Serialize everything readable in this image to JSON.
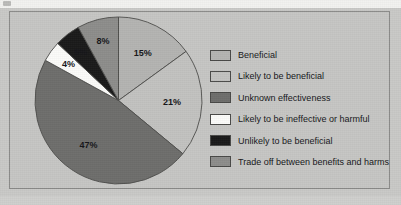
{
  "chart_data": {
    "type": "pie",
    "title": "",
    "categories": [
      "Beneficial",
      "Likely to be beneficial",
      "Unknown effectiveness",
      "Likely to be ineffective or harmful",
      "Unlikely to be beneficial",
      "Trade off between benefits and harms"
    ],
    "values": [
      15,
      21,
      47,
      4,
      5,
      8
    ],
    "value_labels": [
      "15%",
      "21%",
      "47%",
      "4%",
      "5%",
      "8%"
    ],
    "colors": [
      "#b4b4b2",
      "#c2c2c0",
      "#6e6e6c",
      "#fbfbf9",
      "#1a1a1a",
      "#8d8d8b"
    ],
    "label_color": "#16161a",
    "start_angle": 0,
    "direction": "clockwise",
    "legend_position": "right",
    "grid": false,
    "background": "#c6c6c4"
  },
  "legend": {
    "items": [
      {
        "label": "Beneficial",
        "color": "#b4b4b2"
      },
      {
        "label": "Likely to be beneficial",
        "color": "#c2c2c0"
      },
      {
        "label": "Unknown effectiveness",
        "color": "#6e6e6c"
      },
      {
        "label": "Likely to be ineffective or harmful",
        "color": "#fbfbf9"
      },
      {
        "label": "Unlikely to be beneficial",
        "color": "#1a1a1a"
      },
      {
        "label": "Trade off between benefits and harms",
        "color": "#8d8d8b"
      }
    ]
  }
}
